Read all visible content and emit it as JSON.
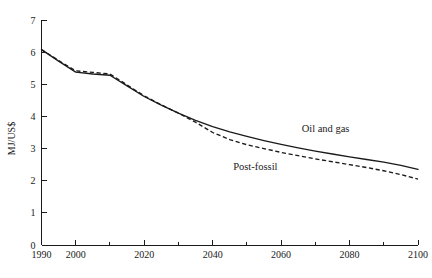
{
  "chart_data": {
    "type": "line",
    "title": "",
    "subtitle": "",
    "xlabel": "",
    "ylabel": "MJ/US$",
    "xlim": [
      1990,
      2100
    ],
    "ylim": [
      0,
      7
    ],
    "grid": false,
    "legend_position": "inline-annotations",
    "x_major_ticks": [
      1990,
      2000,
      2020,
      2040,
      2060,
      2080,
      2100
    ],
    "x_tick_labels": [
      "1990",
      "2000",
      "2020",
      "2040",
      "2060",
      "2080",
      "2100"
    ],
    "x_minor_ticks": [
      2010,
      2030,
      2050,
      2070,
      2090
    ],
    "y_ticks": [
      0,
      1,
      2,
      3,
      4,
      5,
      6,
      7
    ],
    "y_tick_labels": [
      "0",
      "1",
      "2",
      "3",
      "4",
      "5",
      "6",
      "7"
    ],
    "x": [
      1990,
      1995,
      2000,
      2005,
      2010,
      2015,
      2020,
      2025,
      2030,
      2035,
      2040,
      2045,
      2050,
      2055,
      2060,
      2065,
      2070,
      2075,
      2080,
      2085,
      2090,
      2095,
      2100
    ],
    "series": [
      {
        "name": "Oil and gas",
        "style": "solid",
        "color": "#1a1a1a",
        "values": [
          6.08,
          5.72,
          5.38,
          5.32,
          5.28,
          4.95,
          4.62,
          4.35,
          4.1,
          3.88,
          3.68,
          3.52,
          3.38,
          3.25,
          3.13,
          3.02,
          2.92,
          2.83,
          2.74,
          2.66,
          2.58,
          2.48,
          2.35
        ]
      },
      {
        "name": "Post-fossil",
        "style": "dashed",
        "color": "#1a1a1a",
        "values": [
          6.08,
          5.74,
          5.42,
          5.37,
          5.32,
          4.98,
          4.64,
          4.36,
          4.1,
          3.82,
          3.5,
          3.28,
          3.12,
          3.0,
          2.88,
          2.78,
          2.68,
          2.59,
          2.5,
          2.41,
          2.31,
          2.19,
          2.05
        ]
      }
    ],
    "annotations": [
      {
        "text": "Oil and gas",
        "x": 2066,
        "y": 3.52
      },
      {
        "text": "Post-fossil",
        "x": 2046,
        "y": 2.33
      }
    ]
  }
}
